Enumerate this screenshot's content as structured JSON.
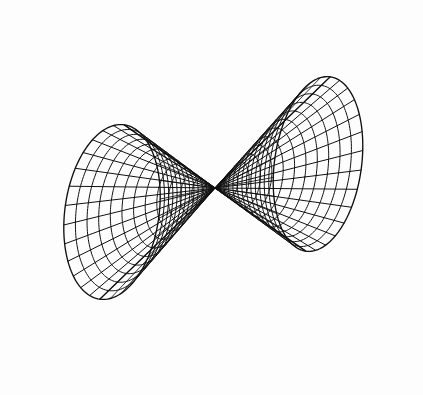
{
  "figure": {
    "kind": "3d-surface-wireframe",
    "background_color": "#fdfdfd",
    "line_color": "#111111",
    "line_width": 1,
    "width": 423,
    "height": 395
  },
  "chart_data": {
    "type": "line",
    "title": "Double cone (two nappes) wireframe mesh",
    "subtitle": "",
    "xlabel": "",
    "ylabel": "",
    "zlabel": "",
    "grid": false,
    "axes_visible": false,
    "legend": false,
    "legend_position": "none",
    "surface": {
      "name": "double-cone",
      "equation": "x^2 + y^2 = (k*z)^2",
      "parametric": "(r*cos(theta), r*sin(theta), r/k) and (r*cos(theta), r*sin(theta), -r/k)",
      "nappes": 2,
      "mesh_radial_divisions": 13,
      "mesh_angular_divisions": 28,
      "wireframe": true,
      "shaded": false,
      "hidden_lines_removed": false
    },
    "projection": {
      "type": "orthographic",
      "apex_px": [
        215,
        188
      ],
      "axis_direction_px": [
        1,
        -0.12
      ],
      "note": "view is nearly down the cone axis so each nappe projects to a tilted elliptical fan"
    },
    "nappes": [
      {
        "name": "left-nappe",
        "direction": "left",
        "apex_px": [
          215,
          188
        ],
        "rim_center_px": [
          112,
          212
        ],
        "rim_semi_major_px": 88,
        "rim_semi_minor_px": 157,
        "rim_rotation_deg": 8,
        "extent_px": {
          "x_min": 25,
          "x_max": 205,
          "y_min": 55,
          "y_max": 368
        }
      },
      {
        "name": "right-nappe",
        "direction": "right",
        "apex_px": [
          215,
          188
        ],
        "rim_center_px": [
          318,
          164
        ],
        "rim_semi_major_px": 88,
        "rim_semi_minor_px": 145,
        "rim_rotation_deg": 8,
        "extent_px": {
          "x_min": 228,
          "x_max": 406,
          "y_min": 20,
          "y_max": 310
        }
      }
    ],
    "x": [],
    "values": [],
    "categories": [],
    "annotations": [],
    "tick_labels": {
      "x": [],
      "y": []
    },
    "xlim": [
      0,
      423
    ],
    "ylim": [
      0,
      395
    ]
  }
}
